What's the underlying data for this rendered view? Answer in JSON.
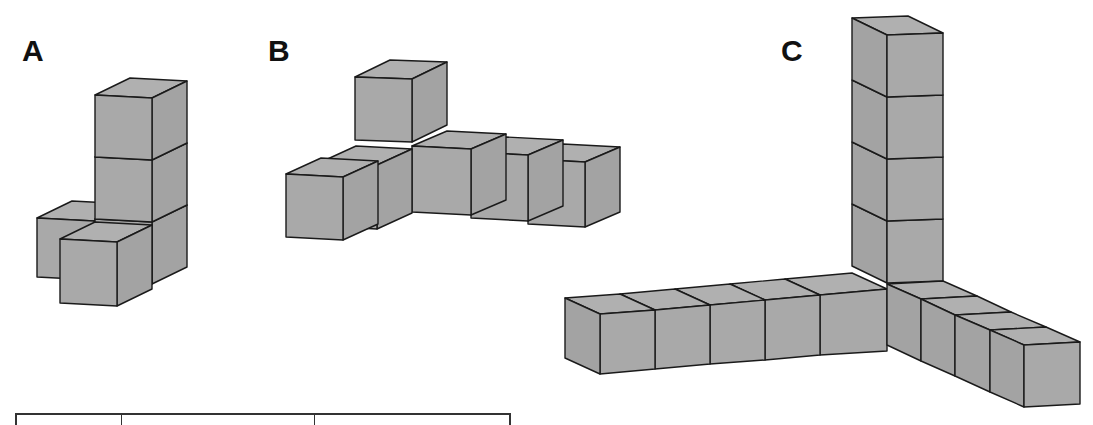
{
  "figure": {
    "labels": [
      {
        "id": "A",
        "text": "A",
        "x": 22,
        "y": 38
      },
      {
        "id": "B",
        "text": "B",
        "x": 268,
        "y": 38
      },
      {
        "id": "C",
        "text": "C",
        "x": 781,
        "y": 38
      }
    ],
    "colors": {
      "cube_fill": "#a9a9a9",
      "cube_top": "#b0b0b0",
      "cube_side": "#a3a3a3",
      "edge": "#1a1a1a",
      "background": "#ffffff"
    },
    "structures": [
      {
        "id": "A",
        "cube_count": 5,
        "description": "Tower of 3 cubes with 2 cubes attached at the base (one in front, one to the left-back)"
      },
      {
        "id": "B",
        "cube_count": 7,
        "description": "One cube raised on top at the corner, 2 cubes extending toward the front-left, 3 cubes extending to the right"
      },
      {
        "id": "C",
        "cube_count": 14,
        "description": "Three orthogonal arms meeting at a corner: vertical tower of 4 cubes, arm of 5 cubes to the left, arm of 4 cubes toward the front-right"
      }
    ]
  },
  "table": {
    "columns": [
      {
        "width": 105
      },
      {
        "width": 193
      },
      {
        "width": 194
      }
    ]
  }
}
